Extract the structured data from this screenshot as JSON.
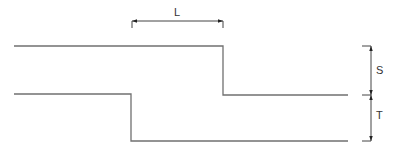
{
  "diagram": {
    "type": "step-offset dimension drawing",
    "line_color": "#707070",
    "dim_color": "#333333",
    "labels": {
      "length": "L",
      "upper_offset": "S",
      "lower_offset": "T"
    },
    "upper_profile": {
      "left_level_y": 46,
      "step_x": 223,
      "right_level_y": 95
    },
    "lower_profile": {
      "left_level_y": 94,
      "step_x": 131,
      "right_level_y": 141
    },
    "dimensions": [
      {
        "name": "L",
        "description": "horizontal distance between steps"
      },
      {
        "name": "S",
        "description": "vertical step of upper profile"
      },
      {
        "name": "T",
        "description": "vertical step of lower profile"
      }
    ]
  }
}
